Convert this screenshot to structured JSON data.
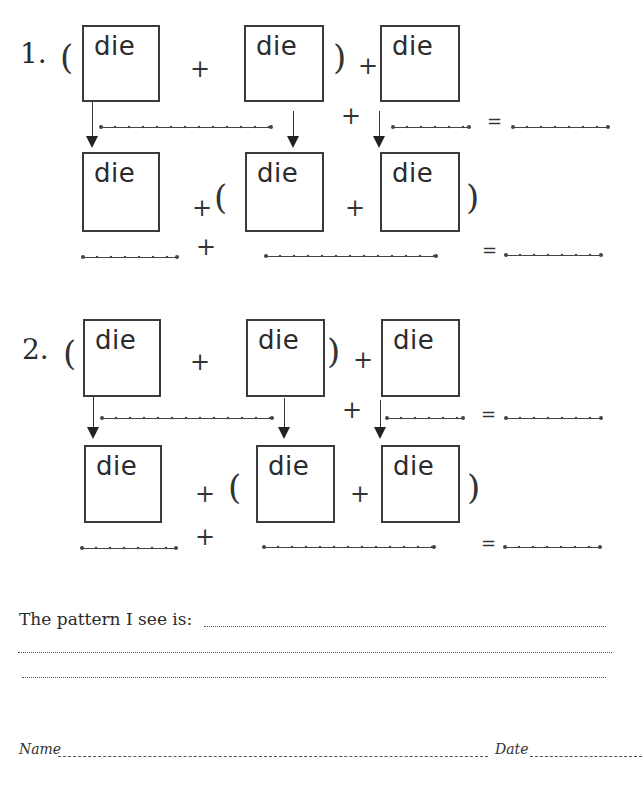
{
  "worksheet": {
    "box_label": "die",
    "plus": "+",
    "equals": "=",
    "open_paren": "(",
    "close_paren": ")",
    "problems": [
      {
        "number": "1.",
        "top_row": [
          "die",
          "die",
          "die"
        ],
        "bottom_row": [
          "die",
          "die",
          "die"
        ],
        "top_expression": "( die + die ) + die",
        "bottom_expression": "die + ( die + die )"
      },
      {
        "number": "2.",
        "top_row": [
          "die",
          "die",
          "die"
        ],
        "bottom_row": [
          "die",
          "die",
          "die"
        ],
        "top_expression": "( die + die ) + die",
        "bottom_expression": "die + ( die + die )"
      }
    ],
    "pattern_prompt": "The pattern I see is:",
    "footer": {
      "name_label": "Name",
      "date_label": "Date"
    }
  }
}
